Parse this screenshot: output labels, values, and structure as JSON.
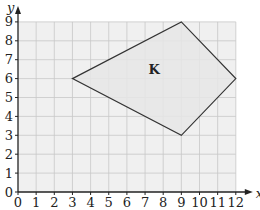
{
  "diagram": {
    "x_axis": {
      "label": "x",
      "min": 0,
      "max": 12,
      "ticks": [
        "0",
        "1",
        "2",
        "3",
        "4",
        "5",
        "6",
        "7",
        "8",
        "9",
        "10",
        "11",
        "12"
      ]
    },
    "y_axis": {
      "label": "y",
      "min": 0,
      "max": 9,
      "ticks": [
        "0",
        "1",
        "2",
        "3",
        "4",
        "5",
        "6",
        "7",
        "8",
        "9"
      ]
    },
    "shape": {
      "label": "K",
      "vertices": [
        [
          3,
          6
        ],
        [
          9,
          9
        ],
        [
          12,
          6
        ],
        [
          9,
          3
        ]
      ],
      "label_position": [
        7.5,
        6.5
      ]
    },
    "colors": {
      "grid": "#c8c8c8",
      "grid_bg": "#f0f0f0",
      "shape_fill": "#e6e6e6",
      "outline": "#333333",
      "axis": "#222222"
    }
  }
}
